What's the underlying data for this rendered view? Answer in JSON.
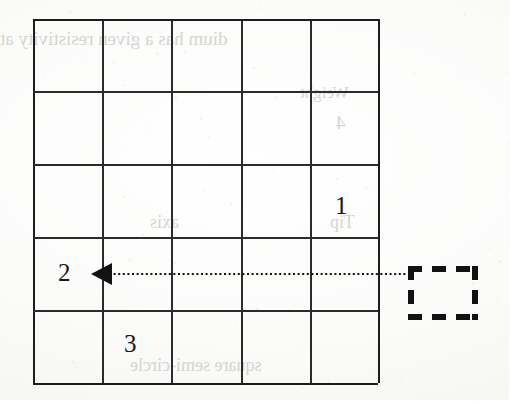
{
  "figure": {
    "type": "diagram",
    "background_color": "#fdfdfc",
    "ink_color": "#1d1d1d"
  },
  "grid": {
    "columns": 5,
    "rows": 5,
    "left": 33,
    "top": 19,
    "width": 345,
    "height": 364,
    "cell_width": 69,
    "cell_height": 72.8,
    "line_color": "#2b2b2b",
    "vertical_lines_x": [
      0,
      69,
      138,
      208,
      277,
      345
    ],
    "horizontal_lines_y": [
      0,
      72,
      145,
      218,
      291,
      364
    ]
  },
  "cell_labels": [
    {
      "text": "1",
      "row": 3,
      "column": 5,
      "x": 335,
      "y": 193
    },
    {
      "text": "2",
      "row": 4,
      "column": 1,
      "x": 58,
      "y": 260
    },
    {
      "text": "3",
      "row": 5,
      "column": 2,
      "x": 124,
      "y": 331
    }
  ],
  "arrow": {
    "name": "dotted-arrow-pointing-left",
    "style": "dotted",
    "color": "#121212",
    "line_y": 274,
    "line_start_x": 410,
    "line_end_x": 112,
    "head_tip_x": 91,
    "head_base_x": 112,
    "head_height": 22,
    "direction": "left"
  },
  "dashed_box": {
    "name": "dashed-target-box",
    "left": 408,
    "top": 266,
    "width": 70,
    "height": 54,
    "stroke_color": "#121212",
    "dash_length": 14,
    "gap_length": 10,
    "stroke_width": 6
  },
  "bleed_through": {
    "note": "faint mirrored text bleeding through from the reverse side of the scanned page",
    "color": "#cfcfcb",
    "lines": [
      {
        "text": "dium has a given resistivity at",
        "x": 0,
        "y": 28,
        "size": 19
      },
      {
        "text": "Weight",
        "x": 300,
        "y": 83,
        "size": 17
      },
      {
        "text": "4",
        "x": 336,
        "y": 112,
        "size": 19
      },
      {
        "text": "axis",
        "x": 150,
        "y": 212,
        "size": 18
      },
      {
        "text": "Tip",
        "x": 330,
        "y": 212,
        "size": 18
      },
      {
        "text": "square    semi-circle",
        "x": 130,
        "y": 355,
        "size": 18
      }
    ]
  }
}
